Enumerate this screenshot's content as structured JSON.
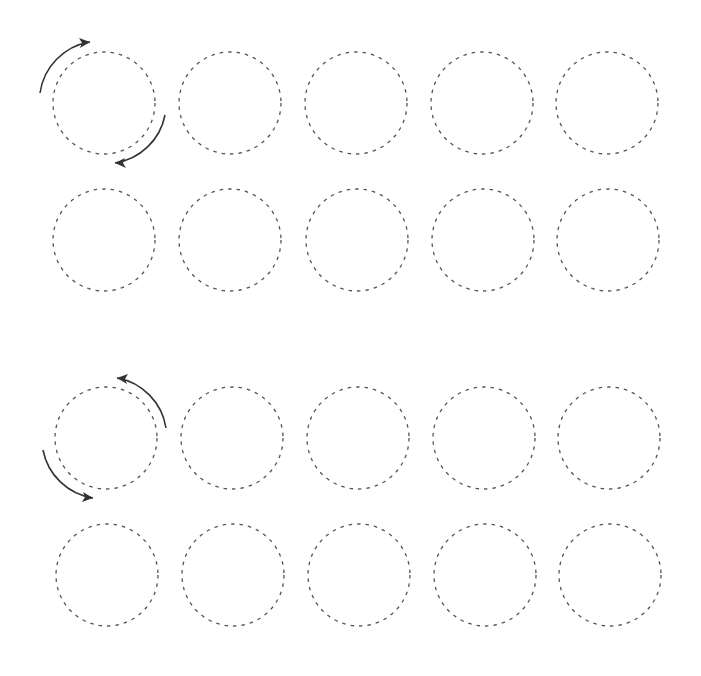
{
  "worksheet": {
    "type": "circle-tracing-practice",
    "background": "#ffffff",
    "circle_stroke": "#555555",
    "arrow_stroke": "#333333",
    "radius": 51,
    "sections": [
      {
        "name": "clockwise",
        "direction": "clockwise",
        "rows": [
          {
            "y": 103,
            "xs": [
              104,
              230,
              356,
              482,
              607
            ]
          },
          {
            "y": 240,
            "xs": [
              104,
              230,
              357,
              483,
              608
            ]
          }
        ],
        "arrows": [
          {
            "d": "M40,93 A60,60 0 0 1 90,42",
            "head": "M90,42 l-11,-4 l3,5 l-2,5 z"
          },
          {
            "d": "M165,115 A60,60 0 0 1 115,163",
            "head": "M115,163 l11,5 l-3,-5 l2,-5 z"
          }
        ]
      },
      {
        "name": "counter-clockwise",
        "direction": "counter-clockwise",
        "rows": [
          {
            "y": 438,
            "xs": [
              106,
              232,
              358,
              484,
              609
            ]
          },
          {
            "y": 575,
            "xs": [
              107,
              233,
              359,
              485,
              610
            ]
          }
        ],
        "arrows": [
          {
            "d": "M166,428 A60,60 0 0 0 117,378",
            "head": "M117,378 l11,-4 l-3,5 l2,5 z"
          },
          {
            "d": "M43,450 A60,60 0 0 0 93,498",
            "head": "M93,498 l-11,4 l3,-5 l-2,-5 z"
          }
        ]
      }
    ]
  }
}
